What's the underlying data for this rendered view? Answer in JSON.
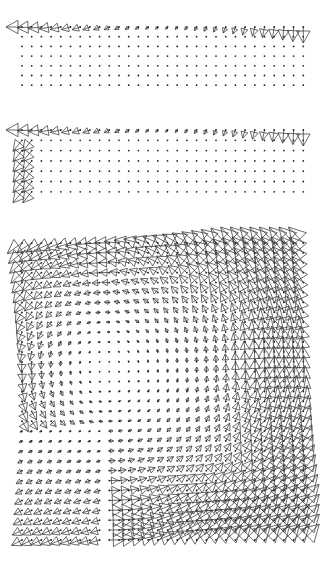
{
  "chart_data": [
    {
      "type": "quiver",
      "title": "",
      "panel": 1,
      "grid": {
        "cols": 30,
        "rows": 7,
        "x0": 22,
        "dx": 9.7,
        "y0": 27,
        "dy": 9.7
      },
      "region": {
        "top": 0,
        "height": 110
      },
      "description": "Vectors only along top row: pointing left at left edge (large), shrinking toward middle, turning to point downward at right edge (large). Remaining grid points are dots.",
      "active": {
        "top_row": true,
        "left_cols": 0
      },
      "glyph": "triangle",
      "color": "#3a3a3a"
    },
    {
      "type": "quiver",
      "title": "",
      "panel": 2,
      "grid": {
        "cols": 30,
        "rows": 7,
        "x0": 22,
        "dx": 9.7,
        "y0": 130,
        "dy": 10.3
      },
      "region": {
        "top": 110,
        "height": 105
      },
      "description": "Top row as in panel 1, plus the two leftmost columns carry large down-left vectors.",
      "active": {
        "top_row": true,
        "left_cols": 2
      },
      "glyph": "triangle",
      "color": "#3a3a3a"
    },
    {
      "type": "quiver",
      "title": "",
      "panel": 3,
      "grid": {
        "cols": 30,
        "rows": 31,
        "x0": 22,
        "dx": 9.7,
        "y0": 243,
        "dy": 9.9
      },
      "region": {
        "top": 215,
        "height": 356
      },
      "description": "Full rotational field: upper-left vectors point left, right side points down, lower-right points right, lower-left points down-left; vortex center near upper-left-middle with small magnitudes.",
      "vortex_center": {
        "u": 0.3,
        "v": 0.42
      },
      "active": {
        "full": true
      },
      "glyph": "triangle",
      "color": "#3a3a3a"
    }
  ]
}
